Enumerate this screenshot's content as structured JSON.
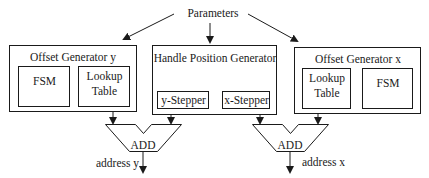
{
  "diagram": {
    "source_node": {
      "label": "Parameters"
    },
    "offset_generator_y": {
      "title": "Offset Generator y",
      "fsm": {
        "label": "FSM"
      },
      "lookup_table": {
        "line1": "Lookup",
        "line2": "Table"
      }
    },
    "handle_position_generator": {
      "title": "Handle Position Generator",
      "y_stepper": {
        "label": "y-Stepper"
      },
      "x_stepper": {
        "label": "x-Stepper"
      }
    },
    "offset_generator_x": {
      "title": "Offset Generator x",
      "lookup_table": {
        "line1": "Lookup",
        "line2": "Table"
      },
      "fsm": {
        "label": "FSM"
      }
    },
    "adder_y": {
      "label": "ADD",
      "output": "address y"
    },
    "adder_x": {
      "label": "ADD",
      "output": "address x"
    },
    "colors": {
      "line": "#1a1a1a",
      "background": "#ffffff"
    }
  }
}
